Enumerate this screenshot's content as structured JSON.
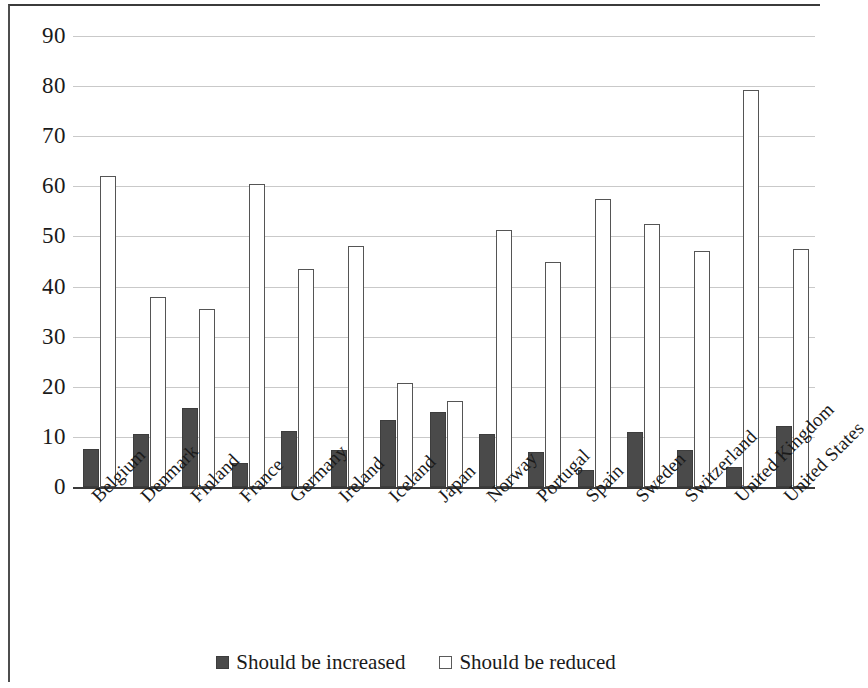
{
  "chart_data": {
    "type": "bar",
    "title": "",
    "subtitle": "",
    "xlabel": "",
    "ylabel": "",
    "ylim": [
      0,
      90
    ],
    "yticks": [
      0,
      10,
      20,
      30,
      40,
      50,
      60,
      70,
      80,
      90
    ],
    "grid": true,
    "legend_position": "bottom",
    "categories": [
      "Belgium",
      "Denmark",
      "Finland",
      "France",
      "Germany",
      "Ireland",
      "Iceland",
      "Japan",
      "Norway",
      "Portugal",
      "Spain",
      "Sweden",
      "Switzerland",
      "United Kingdom",
      "United States"
    ],
    "series": [
      {
        "name": "Should be increased",
        "color": "#4a4a4a",
        "values": [
          7.5,
          10.5,
          15.8,
          4.8,
          11.2,
          7.4,
          13.3,
          15.0,
          10.5,
          7.0,
          3.3,
          10.9,
          7.3,
          4.0,
          12.2
        ]
      },
      {
        "name": "Should be reduced",
        "color": "#ffffff",
        "values": [
          62.0,
          38.0,
          35.5,
          60.5,
          43.5,
          48.0,
          20.8,
          17.2,
          51.3,
          45.0,
          57.5,
          52.5,
          47.0,
          79.3,
          47.5
        ]
      }
    ]
  },
  "legend": {
    "items": [
      {
        "label": "Should be increased",
        "swatch": "filled-dark-square"
      },
      {
        "label": "Should be reduced",
        "swatch": "open-white-square"
      }
    ]
  }
}
